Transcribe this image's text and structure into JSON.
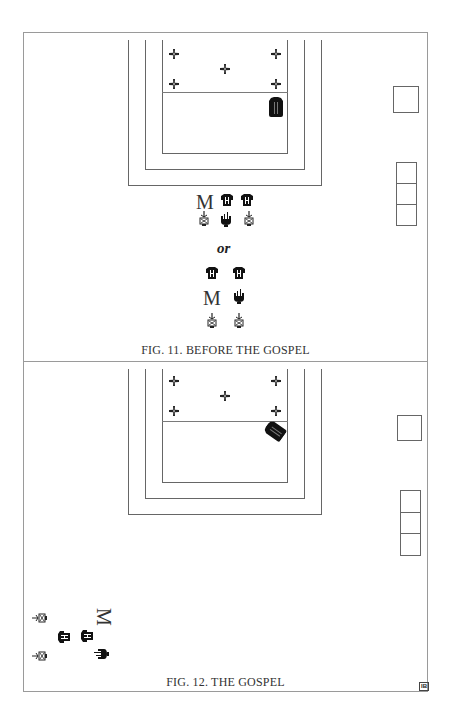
{
  "figures": [
    {
      "caption": "FIG. 11. BEFORE THE GOSPEL",
      "altar_crosses": 5,
      "side_boxes": {
        "single": 1,
        "stacked": 3
      },
      "book_position": "upright, right of altar, below mensa line",
      "group_a": {
        "row1": [
          "M",
          "figure",
          "figure"
        ],
        "row2": [
          "candle",
          "thurible",
          "candle"
        ]
      },
      "separator": "or",
      "group_b": {
        "row1": [
          "figure",
          "figure"
        ],
        "row2": [
          "M",
          "thurible"
        ],
        "row3": [
          "candle",
          "candle"
        ]
      }
    },
    {
      "caption": "FIG. 12. THE GOSPEL",
      "altar_crosses": 5,
      "side_boxes": {
        "single": 1,
        "stacked": 3
      },
      "book_position": "angled, right of altar, below mensa line",
      "group_rotated": {
        "col1": [
          "candle",
          "figure",
          "candle"
        ],
        "col2": [
          "figure"
        ],
        "col3": [
          "M",
          "thurible"
        ]
      },
      "corner_mark": "IB"
    }
  ],
  "labels": {
    "or": "or",
    "m": "M",
    "ib": "IB"
  },
  "colors": {
    "frame": "#9a9a9a",
    "lines": "#666666",
    "ink": "#111111"
  }
}
